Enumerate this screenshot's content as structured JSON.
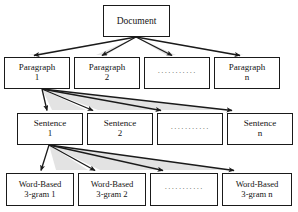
{
  "figure": {
    "background_color": "#ffffff",
    "line_color": "#1a1a1a",
    "shadow_color": "#d9d9d9",
    "text_color": "#141414"
  },
  "levels": [
    {
      "id": "document",
      "label": "Document level",
      "nodes": [
        {
          "line1": "Document",
          "line2": ""
        }
      ]
    },
    {
      "id": "paragraph",
      "label": "Paragraph level",
      "nodes": [
        {
          "line1": "Paragraph",
          "line2": "1"
        },
        {
          "line1": "Paragraph",
          "line2": "2"
        },
        {
          "line1": "···········",
          "line2": ""
        },
        {
          "line1": "Paragraph",
          "line2": "n"
        }
      ]
    },
    {
      "id": "sentence",
      "label": "Sentence level",
      "nodes": [
        {
          "line1": "Sentence",
          "line2": "1"
        },
        {
          "line1": "Sentence",
          "line2": "2"
        },
        {
          "line1": "···········",
          "line2": ""
        },
        {
          "line1": "Sentence",
          "line2": "n"
        }
      ]
    },
    {
      "id": "ngram",
      "label": "Word-based 3-gram level",
      "nodes": [
        {
          "line1": "Word-Based",
          "line2": "3-gram 1"
        },
        {
          "line1": "Word-Based",
          "line2": "3-gram 2"
        },
        {
          "line1": "···········",
          "line2": ""
        },
        {
          "line1": "Word-Based",
          "line2": "3-gram n"
        }
      ]
    }
  ],
  "edges": {
    "document_to_paragraphs": 4,
    "paragraph1_to_sentences": 4,
    "sentence1_to_ngrams": 4,
    "arrowhead": "filled-triangle"
  }
}
